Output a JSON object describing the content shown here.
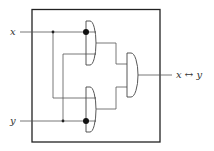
{
  "diagram": {
    "type": "logic-circuit",
    "inputs": [
      {
        "id": "x",
        "label": "x"
      },
      {
        "id": "y",
        "label": "y"
      }
    ],
    "output": {
      "label": "x ↔ y"
    },
    "gates": [
      {
        "id": "g1",
        "kind": "and",
        "position": "top",
        "inputs": [
          "x (dot)",
          "y"
        ]
      },
      {
        "id": "g2",
        "kind": "and",
        "position": "bottom",
        "inputs": [
          "x",
          "y (dot)"
        ]
      },
      {
        "id": "g3",
        "kind": "and",
        "position": "right",
        "inputs": [
          "g1",
          "g2"
        ]
      }
    ],
    "colors": {
      "stroke": "#333333",
      "background": "#ffffff"
    }
  }
}
